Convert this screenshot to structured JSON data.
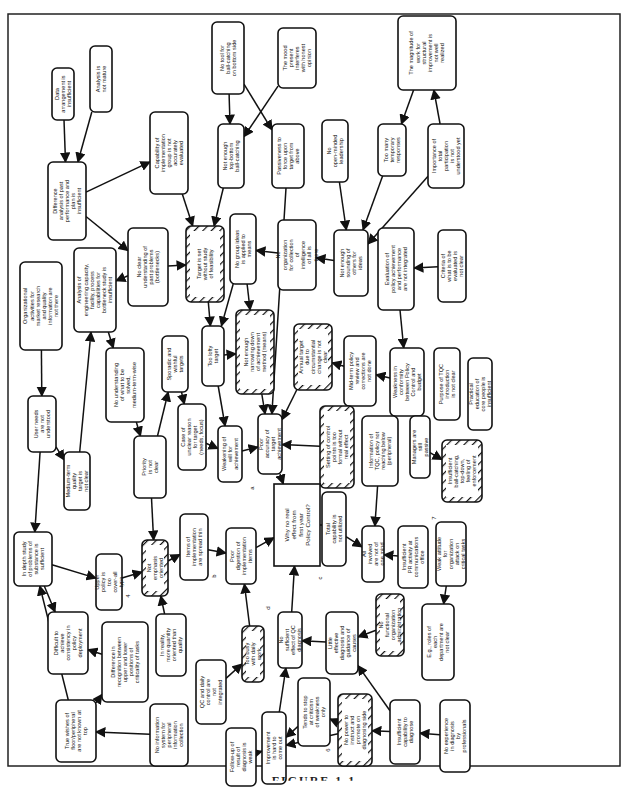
{
  "figure": {
    "caption": "FIGURE 1.1",
    "central_question": "Why no real effect from first year Policy Control?"
  },
  "nodes": [
    {
      "id": "data-arrangement",
      "text": "Data arrangement is insufficient",
      "hatched": false
    },
    {
      "id": "analysis-not-mature",
      "text": "Analysis is not mature",
      "hatched": false
    },
    {
      "id": "difference-analysis",
      "text": "Difference analysis of past performance and plan is insufficient",
      "hatched": false
    },
    {
      "id": "capability-implementation",
      "text": "Capability of implementation group is not accurately evaluated",
      "hatched": false
    },
    {
      "id": "no-tool-ball-catching",
      "text": "No tool for ball-catching on bottom side",
      "hatched": false
    },
    {
      "id": "mood-interferes",
      "text": "The mood present interferes with honest opinion",
      "hatched": false
    },
    {
      "id": "magnitude-work",
      "text": "The magnitude of work for structural improvement is not well realized",
      "hatched": false
    },
    {
      "id": "not-enough-ball-catching",
      "text": "Not enough top-bottom ball-catching",
      "hatched": false
    },
    {
      "id": "passiveness",
      "text": "Passiveness to force upon target from above",
      "hatched": false
    },
    {
      "id": "no-open-minded",
      "text": "No open-minded leadership",
      "hatched": false
    },
    {
      "id": "too-many-temporary",
      "text": "Too many temporary responses",
      "hatched": false
    },
    {
      "id": "importance-participation",
      "text": "Importance of total participation is not understood yet",
      "hatched": false
    },
    {
      "id": "org-activities",
      "text": "Organizational activities for market research and quality information are not there",
      "hatched": false
    },
    {
      "id": "analysis-engineering",
      "text": "Analysis of engineering capacity, facility, process capabilities for bottleneck study is insufficient",
      "hatched": false
    },
    {
      "id": "no-clear-understanding",
      "text": "No clear understanding of past problems (bottlenecks)",
      "hatched": false
    },
    {
      "id": "target-without-study",
      "text": "Target is set without study of feasibility",
      "hatched": true
    },
    {
      "id": "no-group-ideas",
      "text": "No group ideas is applied to means",
      "hatched": false
    },
    {
      "id": "no-org-collection",
      "text": "No organization for collection of intelligence of all is there",
      "hatched": false
    },
    {
      "id": "not-enough-sounding",
      "text": "Not enough sounding of others for ideas",
      "hatched": false
    },
    {
      "id": "evaluation-policy",
      "text": "Evaluation of policy achievement and performance are not integrated",
      "hatched": false
    },
    {
      "id": "criteria-evaluated",
      "text": "Criteria of what is to be evaluated is not clear",
      "hatched": false
    },
    {
      "id": "user-needs",
      "text": "User needs are not understood",
      "hatched": false
    },
    {
      "id": "no-understanding-solved",
      "text": "No understanding of what to be solved, medium-term-wise",
      "hatched": false
    },
    {
      "id": "sporadic-targets",
      "text": "Sporadic and wishful targets",
      "hatched": false
    },
    {
      "id": "too-lofty",
      "text": "Too lofty target",
      "hatched": false
    },
    {
      "id": "not-enough-narrowing",
      "text": "Not enough narrowing down of achievement method (means)",
      "hatched": true
    },
    {
      "id": "annual-target",
      "text": "Annual target due to circumstantial change is not clear",
      "hatched": true
    },
    {
      "id": "mid-term-review",
      "text": "Mid-term policy review and corrections are not done",
      "hatched": false
    },
    {
      "id": "weakness-conformity",
      "text": "Weakness in conformity between Policy Control and budget",
      "hatched": false
    },
    {
      "id": "purpose-tqc",
      "text": "Purpose of TQC introduction is not clear",
      "hatched": false
    },
    {
      "id": "practical-education",
      "text": "Practical education of core people is insufficient",
      "hatched": false
    },
    {
      "id": "medium-term-quality",
      "text": "Medium-term quality target is not clear",
      "hatched": false
    },
    {
      "id": "priority-not-clear",
      "text": "Priority is not clear",
      "hatched": false
    },
    {
      "id": "case-unclear-reason",
      "text": "Case of unclear reason for target (needs, focus)",
      "hatched": false
    },
    {
      "id": "weakening-will",
      "text": "Weakening of will for achievement",
      "hatched": false
    },
    {
      "id": "poor-accuracy",
      "text": "Poor accuracy of target achievement",
      "hatched": false
    },
    {
      "id": "setting-control-points",
      "text": "Setting of control points is too formal without real effect",
      "hatched": true
    },
    {
      "id": "information-tqc",
      "text": "Information of TQC, policy not reaching below (peripheral)",
      "hatched": false
    },
    {
      "id": "managers-passive",
      "text": "Managers are still passive",
      "hatched": false
    },
    {
      "id": "insufficient-ball-catching",
      "text": "Insufficient ball-catching, top-down, feeling of enforcement",
      "hatched": true
    },
    {
      "id": "in-depth-study",
      "text": "In depth study of problems of substance is sufficient",
      "hatched": false
    },
    {
      "id": "upper-policy",
      "text": "Upper policy is too cover-all type",
      "hatched": false
    },
    {
      "id": "not-emphasis",
      "text": "Not emphasis oriented",
      "hatched": true
    },
    {
      "id": "items-spread-thin",
      "text": "Items of implementation are spread thin",
      "hatched": false
    },
    {
      "id": "poor-digestion",
      "text": "Poor digestion of implementation items",
      "hatched": false
    },
    {
      "id": "total-capability",
      "text": "Total capability is not utilized",
      "hatched": false
    },
    {
      "id": "all-involved",
      "text": "All involved are not of one mind",
      "hatched": false
    },
    {
      "id": "insufficient-pr",
      "text": "Insufficient PR activity at communications office",
      "hatched": false
    },
    {
      "id": "weak-attitude",
      "text": "Weak attitude for organization attack on critical tasks",
      "hatched": false
    },
    {
      "id": "difficult-consistency",
      "text": "Difficult to achieve consistency in policy deployment",
      "hatched": false
    },
    {
      "id": "difference-recognition",
      "text": "Difference in recognition between upper and lower positions of criticality of tasks",
      "hatched": false
    },
    {
      "id": "in-reality-quantity",
      "text": "In reality, more quantity oriented than quality",
      "hatched": false
    },
    {
      "id": "qc-daily-control",
      "text": "QC and daily control are not integrated",
      "hatched": false
    },
    {
      "id": "too-busy",
      "text": "Too busy with daily work",
      "hatched": true
    },
    {
      "id": "no-sufficient-effect",
      "text": "No sufficient effect of QC diagnosis",
      "hatched": false
    },
    {
      "id": "little-effective-diagnosis",
      "text": "Little effective diagnosis and guidance of causes",
      "hatched": false
    },
    {
      "id": "no-functional-org",
      "text": "No functional organization administration",
      "hatched": true
    },
    {
      "id": "eg-roles",
      "text": "E.g., roles of each department are not clear",
      "hatched": false
    },
    {
      "id": "true-wishes",
      "text": "True wishes of floor/peripheral are not known at top",
      "hatched": false
    },
    {
      "id": "no-information-system",
      "text": "No information system for peripheral information collection",
      "hatched": false
    },
    {
      "id": "follow-up",
      "text": "Follow-up of result of diagnosis is weak",
      "hatched": false
    },
    {
      "id": "improvement-hard",
      "text": "Improvement is hard to come out",
      "hatched": false
    },
    {
      "id": "tends-to-stop",
      "text": "Tends to stop at criticism of weakness only",
      "hatched": false
    },
    {
      "id": "no-power-instruct",
      "text": "No power to instruct and promote on diagnosing side",
      "hatched": true
    },
    {
      "id": "insufficient-capability-diagnose",
      "text": "Insufficient capability to diagnose",
      "hatched": false
    },
    {
      "id": "no-experience-diagnosis",
      "text": "No experience in diagnosis by professionals",
      "hatched": false
    }
  ],
  "branch_labels": [
    "a",
    "b",
    "c",
    "d",
    "4",
    "6",
    "7"
  ]
}
